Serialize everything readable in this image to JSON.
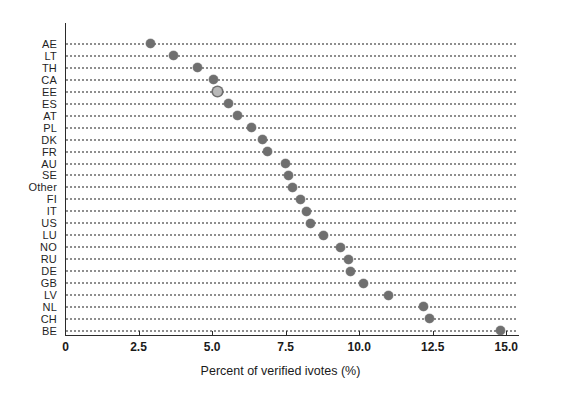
{
  "chart_data": {
    "type": "scatter",
    "title": "",
    "subtitle": "",
    "xlabel": "Percent of verified ivotes (%)",
    "ylabel": "",
    "orientation": "horizontal-dotplot",
    "grid": "dotted-horizontal-rows",
    "legend": "none",
    "xlim": [
      0,
      15.4
    ],
    "xticks": [
      0,
      2.5,
      5.0,
      7.5,
      10.0,
      12.5,
      15.0
    ],
    "xticklabels": [
      "0",
      "2.5",
      "5.0",
      "7.5",
      "10.0",
      "12.5",
      "15.0"
    ],
    "categories": [
      "AE",
      "LT",
      "TH",
      "CA",
      "EE",
      "ES",
      "AT",
      "PL",
      "DK",
      "FR",
      "AU",
      "SE",
      "Other",
      "FI",
      "IT",
      "US",
      "LU",
      "NO",
      "RU",
      "DE",
      "GB",
      "LV",
      "NL",
      "CH",
      "BE"
    ],
    "values": [
      2.9,
      3.7,
      4.5,
      5.05,
      5.2,
      5.55,
      5.85,
      6.35,
      6.7,
      6.9,
      7.5,
      7.6,
      7.75,
      8.0,
      8.2,
      8.35,
      8.8,
      9.35,
      9.65,
      9.7,
      10.15,
      11.0,
      12.2,
      12.4,
      14.8
    ],
    "marker_style": [
      "filled",
      "filled",
      "filled",
      "filled",
      "hollow",
      "filled",
      "filled",
      "filled",
      "filled",
      "filled",
      "filled",
      "filled",
      "filled",
      "filled",
      "filled",
      "filled",
      "filled",
      "filled",
      "filled",
      "filled",
      "filled",
      "filled",
      "filled",
      "filled",
      "filled"
    ],
    "marker_color": "#6f6f6f",
    "gridline_color": "#8e8e8e",
    "axis_color": "#2b2b2b"
  }
}
